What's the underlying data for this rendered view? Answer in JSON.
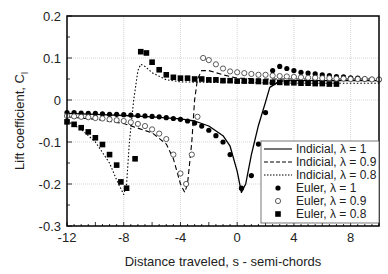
{
  "chart_data": {
    "type": "line",
    "title": "",
    "xlabel": "Distance traveled, s - semi-chords",
    "ylabel": "Lift coefficient, C",
    "ylabel_sub": "l",
    "xlim": [
      -12,
      10
    ],
    "ylim": [
      -0.3,
      0.2
    ],
    "xticks": [
      "-12",
      "-8",
      "-4",
      "0",
      "4",
      "8"
    ],
    "yticks": [
      "0.2",
      "0.1",
      "0",
      "-0.1",
      "-0.2",
      "-0.3"
    ],
    "grid": true,
    "legend_position": "lower right",
    "legend": [
      {
        "label": "Indicial,  λ = 1",
        "style": "solid-line"
      },
      {
        "label": "Indicial,  λ = 0.9",
        "style": "dashed-line"
      },
      {
        "label": "Indicial,  λ = 0.8",
        "style": "dotted-line"
      },
      {
        "label": "Euler,  λ = 1",
        "style": "filled-circle"
      },
      {
        "label": "Euler,  λ = 0.9",
        "style": "open-circle"
      },
      {
        "label": "Euler,  λ = 0.8",
        "style": "filled-square"
      }
    ],
    "series": [
      {
        "name": "Indicial, λ = 1",
        "kind": "line",
        "dash": "",
        "x": [
          -12,
          -10,
          -8,
          -6,
          -4,
          -3,
          -2,
          -1,
          -0.5,
          0,
          0.3,
          0.6,
          1,
          1.5,
          2,
          2.3,
          3,
          4,
          6,
          8,
          10
        ],
        "y": [
          -0.032,
          -0.034,
          -0.037,
          -0.04,
          -0.045,
          -0.05,
          -0.062,
          -0.085,
          -0.11,
          -0.17,
          -0.22,
          -0.2,
          -0.13,
          -0.06,
          -0.005,
          0.03,
          0.045,
          0.046,
          0.046,
          0.046,
          0.046
        ]
      },
      {
        "name": "Indicial, λ = 0.9",
        "kind": "line",
        "dash": "5,3",
        "x": [
          -12,
          -10,
          -8,
          -6,
          -5,
          -4.5,
          -4,
          -3.7,
          -3.5,
          -3.2,
          -3,
          -2.8,
          -2.5,
          -2,
          -1,
          0,
          2,
          4,
          6,
          8,
          10
        ],
        "y": [
          -0.04,
          -0.046,
          -0.056,
          -0.078,
          -0.105,
          -0.14,
          -0.2,
          -0.22,
          -0.2,
          -0.1,
          0,
          0.05,
          0.07,
          0.07,
          0.06,
          0.052,
          0.05,
          0.05,
          0.05,
          0.05,
          0.05
        ]
      },
      {
        "name": "Indicial, λ = 0.8",
        "kind": "line",
        "dash": "1.5,2",
        "x": [
          -12,
          -11,
          -10,
          -9,
          -8.5,
          -8,
          -7.8,
          -7.6,
          -7.3,
          -7,
          -6.8,
          -6.5,
          -6,
          -5,
          -4,
          -2,
          0,
          4,
          8,
          10
        ],
        "y": [
          -0.05,
          -0.07,
          -0.1,
          -0.15,
          -0.19,
          -0.225,
          -0.2,
          -0.1,
          0,
          0.07,
          0.085,
          0.08,
          0.065,
          0.048,
          0.043,
          0.042,
          0.042,
          0.04,
          0.04,
          0.04
        ]
      },
      {
        "name": "Euler, λ = 1",
        "kind": "marker",
        "marker": "filled-circle",
        "x": [
          -12,
          -11.5,
          -11,
          -10.5,
          -10,
          -9.5,
          -9,
          -8.5,
          -8,
          -7.5,
          -7,
          -6.5,
          -6,
          -5.5,
          -5,
          -4.5,
          -4,
          -3.5,
          -3,
          -2.5,
          -2,
          -1.5,
          -1,
          -0.5,
          0.3,
          1,
          1.5,
          2,
          2.5,
          3,
          3.5,
          4,
          4.5,
          5,
          5.5,
          6,
          6.5,
          7,
          7.5,
          8,
          8.5,
          9,
          9.5,
          10
        ],
        "y": [
          -0.03,
          -0.03,
          -0.031,
          -0.032,
          -0.032,
          -0.033,
          -0.034,
          -0.034,
          -0.035,
          -0.036,
          -0.037,
          -0.038,
          -0.039,
          -0.04,
          -0.042,
          -0.044,
          -0.046,
          -0.05,
          -0.055,
          -0.062,
          -0.072,
          -0.085,
          -0.1,
          -0.13,
          -0.21,
          -0.18,
          -0.105,
          -0.03,
          0.07,
          0.08,
          0.075,
          0.07,
          0.066,
          0.064,
          0.062,
          0.06,
          0.058,
          0.056,
          0.055,
          0.053,
          0.052,
          0.05,
          0.049,
          0.048
        ]
      },
      {
        "name": "Euler, λ = 0.9",
        "kind": "marker",
        "marker": "open-circle",
        "x": [
          -12,
          -11.5,
          -11,
          -10.5,
          -10,
          -9.5,
          -9,
          -8.5,
          -8,
          -7.5,
          -7,
          -6.5,
          -6,
          -5.5,
          -5,
          -4.5,
          -4,
          -3.6,
          -3.2,
          -2.8,
          -2.4,
          -2,
          -1.5,
          -1,
          -0.5,
          0,
          0.5,
          1,
          1.5,
          2,
          2.5,
          3,
          3.5,
          4,
          4.5,
          5,
          5.5,
          6,
          6.5,
          7,
          7.5,
          8,
          8.5,
          9,
          9.5,
          10
        ],
        "y": [
          -0.038,
          -0.039,
          -0.04,
          -0.041,
          -0.043,
          -0.044,
          -0.046,
          -0.048,
          -0.05,
          -0.053,
          -0.057,
          -0.062,
          -0.07,
          -0.08,
          -0.093,
          -0.13,
          -0.175,
          -0.2,
          -0.13,
          -0.04,
          0.1,
          0.095,
          0.085,
          0.075,
          0.068,
          0.066,
          0.064,
          0.062,
          0.06,
          0.06,
          0.058,
          0.057,
          0.056,
          0.055,
          0.054,
          0.053,
          0.053,
          0.052,
          0.052,
          0.051,
          0.051,
          0.05,
          0.05,
          0.05,
          0.049,
          0.049
        ]
      },
      {
        "name": "Euler, λ = 0.8",
        "kind": "marker",
        "marker": "filled-square",
        "x": [
          -12,
          -11.5,
          -11,
          -10.5,
          -10,
          -9.5,
          -9,
          -8.5,
          -8.2,
          -7.8,
          -7.2,
          -6.8,
          -6.4,
          -6,
          -5.5,
          -5,
          -4.5,
          -4,
          -3.5,
          -3,
          -2.5,
          -2,
          -1.5,
          -1,
          -0.5,
          0,
          0.5,
          1,
          1.5,
          2,
          2.5,
          3,
          3.5,
          4,
          4.5,
          5,
          5.5,
          6,
          6.5,
          7
        ],
        "y": [
          -0.052,
          -0.058,
          -0.066,
          -0.076,
          -0.09,
          -0.106,
          -0.13,
          -0.155,
          -0.195,
          -0.21,
          -0.14,
          0.115,
          0.112,
          0.09,
          0.072,
          0.06,
          0.054,
          0.052,
          0.052,
          0.05,
          0.05,
          0.048,
          0.048,
          0.046,
          0.046,
          0.045,
          0.045,
          0.045,
          0.044,
          0.043,
          0.042,
          0.042,
          0.041,
          0.041,
          0.04,
          0.04,
          0.039,
          0.039,
          0.038,
          0.038
        ]
      }
    ]
  }
}
